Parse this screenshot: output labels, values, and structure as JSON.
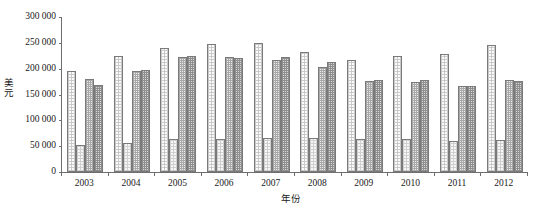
{
  "chart_data": {
    "type": "bar",
    "title": "",
    "subtitle": "",
    "xlabel": "年份",
    "ylabel": "美元",
    "categories": [
      "2003",
      "2004",
      "2005",
      "2006",
      "2007",
      "2008",
      "2009",
      "2010",
      "2011",
      "2012"
    ],
    "series": [
      {
        "name": "series-1",
        "pattern": "fine-dotted-grid",
        "color": "#fbfbfb",
        "values": [
          195000,
          225000,
          240000,
          247000,
          249000,
          233000,
          216000,
          224000,
          228000,
          246000
        ]
      },
      {
        "name": "series-2",
        "pattern": "fine-dotted-grid-light",
        "color": "#f6f6f6",
        "values": [
          52000,
          57000,
          63000,
          64000,
          65000,
          65000,
          63000,
          63000,
          60000,
          62000
        ]
      },
      {
        "name": "series-3",
        "pattern": "medium-checkered",
        "color": "#ededed",
        "values": [
          180000,
          196000,
          222000,
          222000,
          216000,
          203000,
          176000,
          174000,
          167000,
          178000
        ]
      },
      {
        "name": "series-4",
        "pattern": "dark-checkered",
        "color": "#d8d8d8",
        "values": [
          168000,
          197000,
          225000,
          221000,
          222000,
          213000,
          178000,
          178000,
          167000,
          176000
        ]
      }
    ],
    "ylim": [
      0,
      300000
    ],
    "ytick_values": [
      0,
      50000,
      100000,
      150000,
      200000,
      250000,
      300000
    ],
    "ytick_labels": [
      "0",
      "50 000",
      "100 000",
      "150 000",
      "200 000",
      "250 000",
      "300 000"
    ],
    "grid": false,
    "legend": "none",
    "axis_color": "#6e6e6e",
    "bar_border_color": "#7a7a7a",
    "background": "#ffffff"
  }
}
